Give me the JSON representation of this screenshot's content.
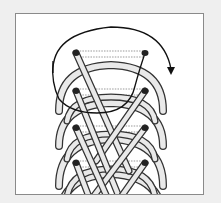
{
  "diagram": {
    "type": "shoelace-lacing-diagram",
    "eyelet_rows": 4,
    "eyelets": [
      {
        "row": 1,
        "left": [
          75,
          52
        ],
        "right": [
          144,
          52
        ]
      },
      {
        "row": 2,
        "left": [
          75,
          90
        ],
        "right": [
          144,
          90
        ]
      },
      {
        "row": 3,
        "left": [
          75,
          127
        ],
        "right": [
          144,
          127
        ]
      },
      {
        "row": 4,
        "left": [
          75,
          162
        ],
        "right": [
          144,
          162
        ]
      }
    ],
    "arrow": {
      "direction": "clockwise",
      "icon": "curved-arrow-icon"
    },
    "colors": {
      "background": "#efefef",
      "panel": "#ffffff",
      "lace_fill": "#e9e9e9",
      "lace_outline": "#333333",
      "eyelet": "#222222",
      "frame_border": "#8a8a8a"
    }
  }
}
